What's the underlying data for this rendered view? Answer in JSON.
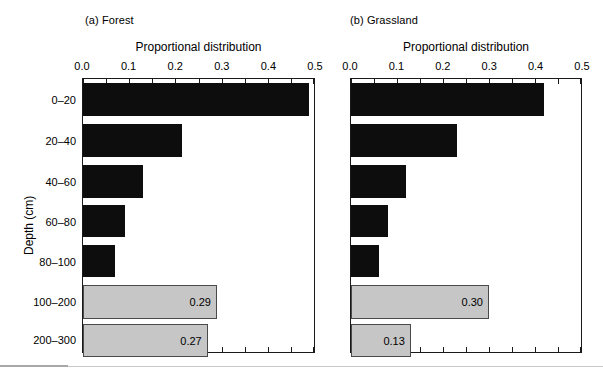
{
  "figure": {
    "background": "#ffffff",
    "dark_bar_color": "#0d0d0d",
    "light_bar_color": "#c6c6c6",
    "light_bar_border": "#4a4a4a",
    "axis_color": "#1a1a1a",
    "y_axis_label": "Depth (cm)"
  },
  "chart_data": {
    "type": "bar",
    "orientation": "horizontal",
    "title": "",
    "xlabel": "Proportional distribution",
    "ylabel": "Depth (cm)",
    "xlim": [
      0.0,
      0.5
    ],
    "xticks": [
      0.0,
      0.1,
      0.2,
      0.3,
      0.4,
      0.5
    ],
    "xticklabels": [
      "0.0",
      "0.1",
      "0.2",
      "0.3",
      "0.4",
      "0.5"
    ],
    "minor_tick_step": 0.05,
    "grid": false,
    "legend": "none",
    "categories": [
      "0–20",
      "20–40",
      "40–60",
      "60–80",
      "80–100",
      "100–200",
      "200–300"
    ],
    "panels": [
      {
        "id": "forest",
        "label": "(a) Forest",
        "axis_title": "Proportional distribution",
        "values": [
          0.49,
          0.215,
          0.13,
          0.09,
          0.07,
          0.29,
          0.27
        ],
        "bar_styles": [
          "dark",
          "dark",
          "dark",
          "dark",
          "dark",
          "light",
          "light"
        ],
        "data_labels": [
          "",
          "",
          "",
          "",
          "",
          "0.29",
          "0.27"
        ]
      },
      {
        "id": "grassland",
        "label": "(b) Grassland",
        "axis_title": "Proportional distribution",
        "values": [
          0.42,
          0.23,
          0.12,
          0.08,
          0.06,
          0.3,
          0.13
        ],
        "bar_styles": [
          "dark",
          "dark",
          "dark",
          "dark",
          "dark",
          "light",
          "light"
        ],
        "data_labels": [
          "",
          "",
          "",
          "",
          "",
          "0.30",
          "0.13"
        ]
      }
    ]
  }
}
